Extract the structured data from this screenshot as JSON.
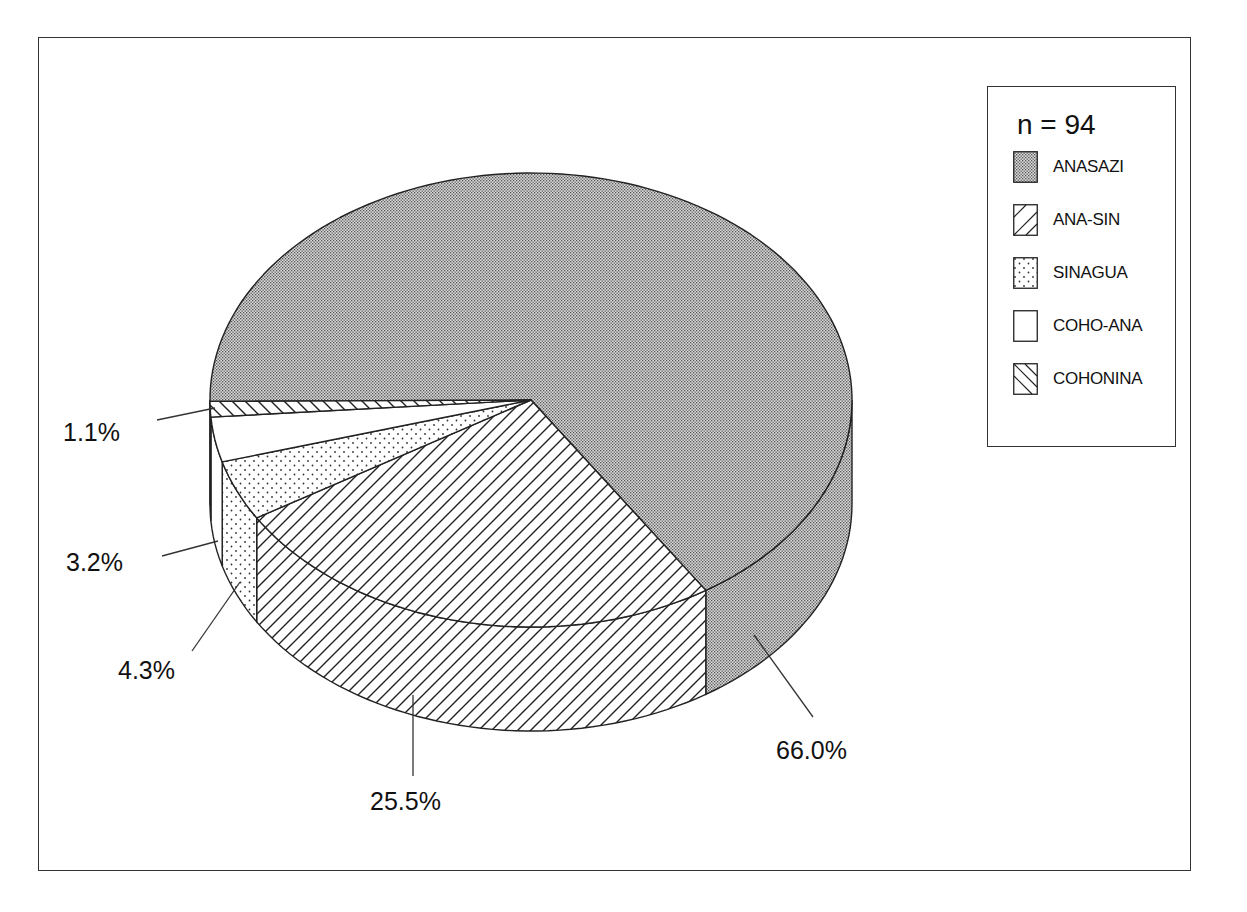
{
  "chart_data": {
    "type": "pie",
    "style": "3d",
    "title": "",
    "sample_size_label": "n = 94",
    "n": 94,
    "legend_position": "right",
    "categories": [
      "ANASAZI",
      "ANA-SIN",
      "SINAGUA",
      "COHO-ANA",
      "COHONINA"
    ],
    "values": [
      66.0,
      25.5,
      4.3,
      3.2,
      1.1
    ],
    "value_labels": [
      "66.0%",
      "25.5%",
      "4.3%",
      "3.2%",
      "1.1%"
    ],
    "fill_patterns": [
      "fine-dark-dots",
      "forward-hatch",
      "sparse-dots",
      "empty",
      "back-hatch"
    ]
  },
  "legend": {
    "n_label": "n = 94",
    "items": [
      {
        "label": "ANASAZI",
        "pattern": "fine-dark-dots"
      },
      {
        "label": "ANA-SIN",
        "pattern": "forward-hatch"
      },
      {
        "label": "SINAGUA",
        "pattern": "sparse-dots"
      },
      {
        "label": "COHO-ANA",
        "pattern": "empty"
      },
      {
        "label": "COHONINA",
        "pattern": "back-hatch"
      }
    ]
  },
  "labels": {
    "anasazi": "66.0%",
    "ana_sin": "25.5%",
    "sinagua": "4.3%",
    "coho_ana": "3.2%",
    "cohonina": "1.1%"
  },
  "colors": {
    "line": "#222222",
    "anasazi_fill": "#b8b8b8"
  }
}
